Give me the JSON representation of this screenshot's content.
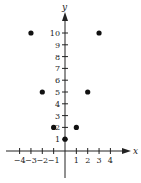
{
  "chart_data": {
    "type": "scatter",
    "title": "",
    "xlabel": "x",
    "ylabel": "y",
    "xlim": [
      -4.5,
      5.5
    ],
    "ylim": [
      -2,
      11.5
    ],
    "grid": false,
    "legend": null,
    "x_ticks": [
      -4,
      -3,
      -2,
      -1,
      1,
      2,
      3,
      4
    ],
    "x_tick_labels": [
      "−4",
      "−3",
      "−2",
      "−1",
      "1",
      "2",
      "3",
      "4"
    ],
    "y_ticks": [
      1,
      2,
      3,
      4,
      5,
      6,
      7,
      8,
      9,
      10
    ],
    "y_tick_labels": [
      "1",
      "2",
      "3",
      "4",
      "5",
      "6",
      "7",
      "8",
      "9",
      "10"
    ],
    "series": [
      {
        "name": "points",
        "x": [
          -3,
          -2,
          -1,
          0,
          1,
          2,
          3
        ],
        "y": [
          10,
          5,
          2,
          1,
          2,
          5,
          10
        ]
      }
    ],
    "colors": {
      "axis": "#222222",
      "point": "#111111"
    }
  }
}
